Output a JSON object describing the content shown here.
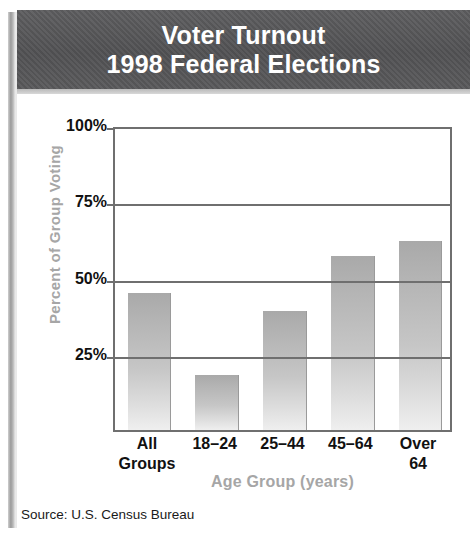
{
  "banner": {
    "line1": "Voter Turnout",
    "line2": "1998 Federal Elections",
    "background_color": "#59595b",
    "text_color": "#ffffff"
  },
  "source_note": "Source: U.S. Census Bureau",
  "colors": {
    "bar_top": "#a9a9a9",
    "bar_bottom": "#efefef",
    "axis": "#6f6f6f",
    "axis_title": "#a6a6a6",
    "tick_label": "#111111"
  },
  "chart_data": {
    "type": "bar",
    "title": "Voter Turnout 1998 Federal Elections",
    "subtitle": "",
    "xlabel": "Age Group (years)",
    "ylabel": "Percent of Group Voting",
    "categories": [
      "All\nGroups",
      "18–24",
      "25–44",
      "45–64",
      "Over\n64"
    ],
    "values": [
      45,
      18,
      39,
      57,
      62
    ],
    "ylim": [
      0,
      100
    ],
    "yticks": [
      0,
      25,
      50,
      75,
      100
    ],
    "ytick_labels": [
      "",
      "25%",
      "50%",
      "75%",
      "100%"
    ],
    "grid": true,
    "grid_axis": "y",
    "legend": false,
    "legend_position": "none",
    "source": "Source: U.S. Census Bureau"
  }
}
